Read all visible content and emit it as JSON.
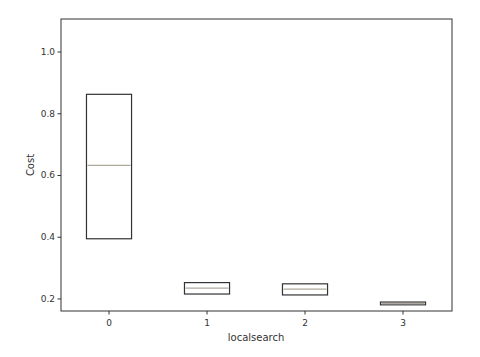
{
  "chart_data": {
    "type": "box",
    "title": "",
    "xlabel": "localsearch",
    "ylabel": "Cost",
    "categories": [
      "0",
      "1",
      "2",
      "3"
    ],
    "x_positions": [
      0,
      1,
      2,
      3
    ],
    "xlim": [
      -0.49,
      3.5
    ],
    "ylim": [
      0.161,
      1.107
    ],
    "yticks": [
      0.2,
      0.4,
      0.6,
      0.8,
      1.0
    ],
    "ytick_labels": [
      "0.2",
      "0.4",
      "0.6",
      "0.8",
      "1.0"
    ],
    "grid": false,
    "legend": null,
    "boxes": [
      {
        "category": "0",
        "q1": 0.395,
        "median": 0.633,
        "q3": 0.863
      },
      {
        "category": "1",
        "q1": 0.216,
        "median": 0.235,
        "q3": 0.253
      },
      {
        "category": "2",
        "q1": 0.213,
        "median": 0.232,
        "q3": 0.249
      },
      {
        "category": "3",
        "q1": 0.181,
        "median": 0.185,
        "q3": 0.19
      }
    ],
    "box_width": 0.46
  },
  "style": {
    "box_edge_color": "#333333",
    "median_color": "#b0a89c",
    "axis_color": "#333333"
  }
}
